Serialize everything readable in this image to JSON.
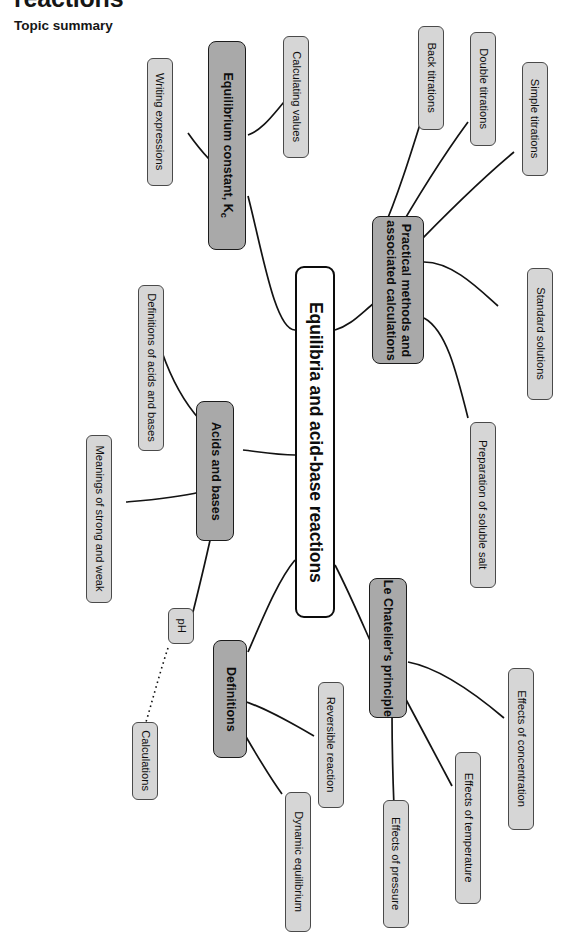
{
  "page": {
    "title_clipped": "reactions",
    "section_heading": "Topic summary",
    "background_color": "#ffffff"
  },
  "colors": {
    "root_fill": "#ffffff",
    "root_border": "#0c0c0c",
    "branch_fill": "#a9a9a9",
    "branch_border": "#1c1c1c",
    "leaf_fill": "#d6d6d6",
    "leaf_border": "#4a4a4a",
    "connector": "#131313",
    "text": "#0d0d0d"
  },
  "mindmap": {
    "type": "mindmap",
    "orientation": "rotated-90-clockwise",
    "root": {
      "label": "Equilibria and acid-base reactions"
    },
    "branches": [
      {
        "label": "Equilibrium constant, K",
        "label_subscript": "c",
        "children": [
          {
            "label": "Writing expressions"
          },
          {
            "label": "Calculating values"
          }
        ]
      },
      {
        "label_line1": "Practical methods and",
        "label_line2": "associated calculations",
        "children": [
          {
            "label": "Back titrations"
          },
          {
            "label": "Double titrations"
          },
          {
            "label": "Simple titrations"
          },
          {
            "label": "Standard solutions"
          },
          {
            "label": "Preparation of soluble salt"
          }
        ]
      },
      {
        "label": "Acids and bases",
        "children": [
          {
            "label": "Definitions of acids and bases"
          },
          {
            "label": "Meanings of strong and weak"
          },
          {
            "label": "pH",
            "connector": "solid"
          },
          {
            "label": "Calculations",
            "connector": "dotted",
            "parent": "pH"
          }
        ]
      },
      {
        "label": "Definitions",
        "children": [
          {
            "label": "Reversible reaction"
          },
          {
            "label": "Dynamic equilibrium"
          }
        ]
      },
      {
        "label": "Le Chatelier's principle",
        "children": [
          {
            "label": "Effects of concentration"
          },
          {
            "label": "Effects of temperature"
          },
          {
            "label": "Effects of pressure"
          }
        ]
      }
    ]
  }
}
